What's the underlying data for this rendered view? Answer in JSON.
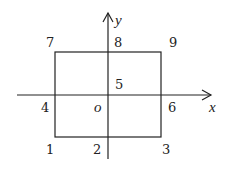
{
  "diagram": {
    "type": "coordinate-plane-with-rectangle",
    "colors": {
      "stroke": "#222222",
      "text": "#222222",
      "background": "#ffffff"
    },
    "axes": {
      "x_label": "x",
      "y_label": "y",
      "origin_label": "o"
    },
    "rectangle": {
      "description": "rectangle centered on the y-axis, crossing the x-axis"
    },
    "points": [
      {
        "id": "p1",
        "label": "1",
        "position": "bottom-left corner"
      },
      {
        "id": "p2",
        "label": "2",
        "position": "bottom edge on y-axis"
      },
      {
        "id": "p3",
        "label": "3",
        "position": "bottom-right corner"
      },
      {
        "id": "p4",
        "label": "4",
        "position": "left edge on x-axis"
      },
      {
        "id": "p5",
        "label": "5",
        "position": "origin"
      },
      {
        "id": "p6",
        "label": "6",
        "position": "right edge on x-axis"
      },
      {
        "id": "p7",
        "label": "7",
        "position": "top-left corner"
      },
      {
        "id": "p8",
        "label": "8",
        "position": "top edge on y-axis"
      },
      {
        "id": "p9",
        "label": "9",
        "position": "top-right corner"
      }
    ]
  }
}
